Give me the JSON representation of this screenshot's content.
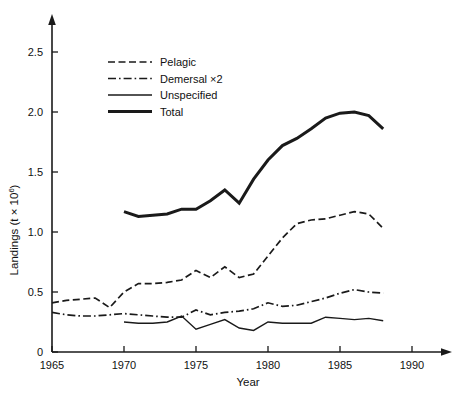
{
  "chart_data": {
    "type": "line",
    "title": "",
    "xlabel": "Year",
    "ylabel": "Landings (t × 10⁶)",
    "ylabel_main": "Landings (t × 10",
    "ylabel_sup": "6",
    "ylabel_tail": ")",
    "xlim": [
      1965,
      1990
    ],
    "ylim": [
      0,
      2.7
    ],
    "grid": false,
    "legend_position": "upper-left-inside",
    "xticks": [
      1965,
      1970,
      1975,
      1980,
      1985,
      1990
    ],
    "xtick_labels": [
      "1965",
      "1970",
      "1975",
      "1980",
      "1985",
      "1990"
    ],
    "yticks": [
      0,
      0.5,
      1.0,
      1.5,
      2.0,
      2.5
    ],
    "ytick_labels": [
      "0",
      "0.5",
      "1.0",
      "1.5",
      "2.0",
      "2.5"
    ],
    "series": [
      {
        "name": "Pelagic",
        "legend_label": "Pelagic",
        "style": "dashed",
        "color": "#1a1a1a",
        "width": 1.7,
        "x": [
          1965,
          1966,
          1967,
          1968,
          1969,
          1970,
          1971,
          1972,
          1973,
          1974,
          1975,
          1976,
          1977,
          1978,
          1979,
          1980,
          1981,
          1982,
          1983,
          1984,
          1985,
          1986,
          1987,
          1988
        ],
        "values": [
          0.41,
          0.43,
          0.44,
          0.45,
          0.37,
          0.5,
          0.57,
          0.57,
          0.58,
          0.6,
          0.68,
          0.62,
          0.71,
          0.62,
          0.65,
          0.8,
          0.95,
          1.07,
          1.1,
          1.11,
          1.14,
          1.17,
          1.15,
          1.03
        ]
      },
      {
        "name": "Demersal ×2",
        "legend_label": "Demersal ×2",
        "style": "dashdot",
        "color": "#1a1a1a",
        "width": 1.7,
        "x": [
          1965,
          1966,
          1967,
          1968,
          1969,
          1970,
          1971,
          1972,
          1973,
          1974,
          1975,
          1976,
          1977,
          1978,
          1979,
          1980,
          1981,
          1982,
          1983,
          1984,
          1985,
          1986,
          1987,
          1988
        ],
        "values": [
          0.33,
          0.31,
          0.3,
          0.3,
          0.31,
          0.32,
          0.31,
          0.3,
          0.29,
          0.29,
          0.35,
          0.31,
          0.33,
          0.34,
          0.36,
          0.41,
          0.38,
          0.39,
          0.42,
          0.45,
          0.49,
          0.52,
          0.5,
          0.49
        ]
      },
      {
        "name": "Unspecified",
        "legend_label": "Unspecified",
        "style": "solid",
        "color": "#1a1a1a",
        "width": 1.4,
        "x": [
          1970,
          1971,
          1972,
          1973,
          1974,
          1975,
          1976,
          1977,
          1978,
          1979,
          1980,
          1981,
          1982,
          1983,
          1984,
          1985,
          1986,
          1987,
          1988
        ],
        "values": [
          0.25,
          0.24,
          0.24,
          0.25,
          0.3,
          0.19,
          0.23,
          0.27,
          0.2,
          0.18,
          0.25,
          0.24,
          0.24,
          0.24,
          0.29,
          0.28,
          0.27,
          0.28,
          0.26
        ]
      },
      {
        "name": "Total",
        "legend_label": "Total",
        "style": "solid",
        "color": "#1a1a1a",
        "width": 3.0,
        "x": [
          1970,
          1971,
          1972,
          1973,
          1974,
          1975,
          1976,
          1977,
          1978,
          1979,
          1980,
          1981,
          1982,
          1983,
          1984,
          1985,
          1986,
          1987,
          1988
        ],
        "values": [
          1.17,
          1.13,
          1.14,
          1.15,
          1.19,
          1.19,
          1.26,
          1.35,
          1.24,
          1.44,
          1.6,
          1.72,
          1.78,
          1.86,
          1.95,
          1.99,
          2.0,
          1.97,
          1.86
        ]
      }
    ]
  },
  "axes": {
    "x_axis_name": "year-axis",
    "y_axis_name": "landings-axis"
  }
}
